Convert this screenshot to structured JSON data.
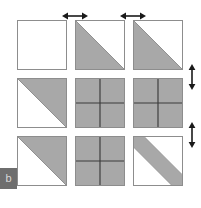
{
  "figure": {
    "label_badge": "b",
    "colors": {
      "fill_gray": "#a8a8a8",
      "outline_gray": "#8d8d8d",
      "divider_dark": "#3a3a3a",
      "arrow_black": "#1a1a1a",
      "background_white": "#ffffff",
      "badge_bg": "#6e6e6e",
      "badge_fg": "#d8d8d8"
    },
    "grid": {
      "rows": 3,
      "columns": 3,
      "cell_size_px": 50,
      "gap_px": 8,
      "cells": [
        {
          "id": "cell-r1-c1",
          "row": 1,
          "col": 1,
          "pattern": "empty",
          "description": "empty white square"
        },
        {
          "id": "cell-r1-c2",
          "row": 1,
          "col": 2,
          "pattern": "triangle-lower-left",
          "description": "gray lower-left triangle"
        },
        {
          "id": "cell-r1-c3",
          "row": 1,
          "col": 3,
          "pattern": "triangle-lower-left",
          "description": "gray lower-left triangle"
        },
        {
          "id": "cell-r2-c1",
          "row": 2,
          "col": 1,
          "pattern": "triangle-upper-right",
          "description": "gray upper-right triangle"
        },
        {
          "id": "cell-r2-c2",
          "row": 2,
          "col": 2,
          "pattern": "full-quartered",
          "description": "solid gray square divided into four quadrants"
        },
        {
          "id": "cell-r2-c3",
          "row": 2,
          "col": 3,
          "pattern": "full-quartered",
          "description": "solid gray square divided into four quadrants"
        },
        {
          "id": "cell-r3-c1",
          "row": 3,
          "col": 1,
          "pattern": "triangle-upper-right",
          "description": "gray upper-right triangle"
        },
        {
          "id": "cell-r3-c2",
          "row": 3,
          "col": 2,
          "pattern": "full-quartered",
          "description": "solid gray square divided into four quadrants"
        },
        {
          "id": "cell-r3-c3",
          "row": 3,
          "col": 3,
          "pattern": "diagonal-band",
          "description": "gray diagonal band from top-left to bottom-right"
        }
      ]
    },
    "dimension_arrows": [
      {
        "id": "arrow-top-1",
        "orientation": "horizontal",
        "position": "top",
        "between": "column 1 and column 2",
        "label": ""
      },
      {
        "id": "arrow-top-2",
        "orientation": "horizontal",
        "position": "top",
        "between": "column 2 and column 3",
        "label": ""
      },
      {
        "id": "arrow-right-1",
        "orientation": "vertical",
        "position": "right",
        "between": "row 1 and row 2",
        "label": ""
      },
      {
        "id": "arrow-right-2",
        "orientation": "vertical",
        "position": "right",
        "between": "row 2 and row 3",
        "label": ""
      }
    ]
  }
}
